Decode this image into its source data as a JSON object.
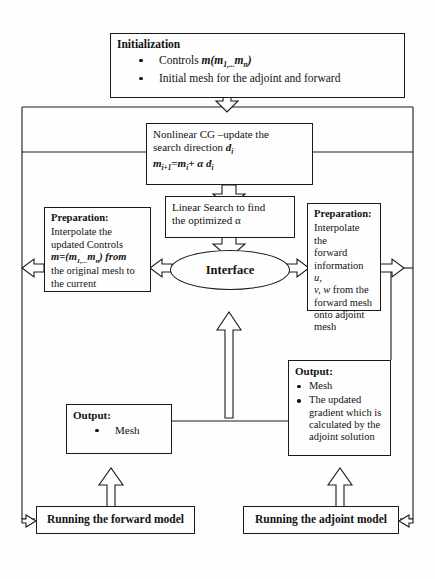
{
  "diagram": {
    "stroke_color": "#1a1a1a",
    "background_color": "#fefefe"
  },
  "nodes": {
    "initialization": {
      "name": "Initialization",
      "title": "Initialization",
      "bullets": [
        "Controls m(m1,...mn)",
        "Initial mesh for the adjoint and forward"
      ],
      "bullet1_prefix": "Controls ",
      "bullet1_math": "m(m",
      "bullet1_sub1": "1,...",
      "bullet1_mid": "m",
      "bullet1_sub2": "n",
      "bullet1_suffix": ")",
      "bullet2": "Initial mesh for the adjoint and forward"
    },
    "nonlinear_cg": {
      "line1": "Nonlinear CG –update the",
      "line2_prefix": "search direction ",
      "line2_math": "d",
      "line2_sub": "i",
      "line3_a": "m",
      "line3_a_sub": "i+1",
      "line3_b": "=m",
      "line3_b_sub": "i",
      "line3_c": "+ α ",
      "line3_d": "d",
      "line3_d_sub": "i"
    },
    "linear_search": {
      "line1": "Linear Search to find",
      "line2": "the optimized α"
    },
    "interface": {
      "label": "Interface"
    },
    "preparation_left": {
      "title": "Preparation:",
      "line1": "Interpolate the",
      "line2": "updated Controls",
      "line3_a": "m=(m",
      "line3_sub1": "1,...",
      "line3_b": "m",
      "line3_sub2": "n",
      "line3_c": ") from",
      "line4": "the original mesh to",
      "line5": "the current"
    },
    "preparation_right": {
      "title": "Preparation:",
      "line1": "Interpolate the",
      "line2": "forward",
      "line3_prefix": "information ",
      "line3_math": "u,",
      "line4_math": "v, w",
      "line4_suffix": " from the",
      "line5": "forward mesh",
      "line6": "onto adjoint",
      "line7": "mesh"
    },
    "output_left": {
      "title": "Output:",
      "bullets": [
        "Mesh"
      ]
    },
    "output_right": {
      "title": "Output:",
      "bullets": [
        "Mesh",
        "The updated gradient which is calculated by the adjoint solution"
      ],
      "bullet2_line1": "The updated",
      "bullet2_line2": "gradient which is",
      "bullet2_line3": "calculated by the",
      "bullet2_line4": "adjoint solution"
    },
    "forward_model": {
      "label": "Running the forward model"
    },
    "adjoint_model": {
      "label": "Running the adjoint model"
    }
  }
}
